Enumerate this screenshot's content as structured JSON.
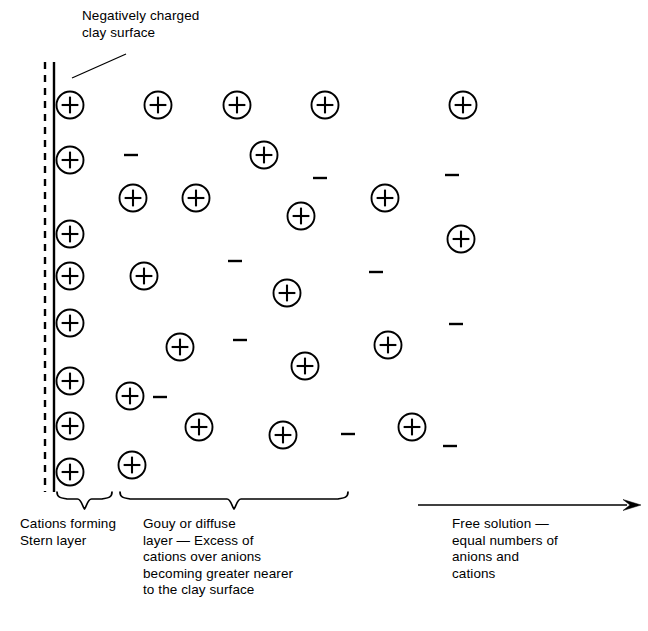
{
  "figure": {
    "type": "diagram",
    "background_color": "#ffffff",
    "ink_color": "#000000",
    "width": 648,
    "height": 631
  },
  "annotations": {
    "surface_label": "Negatively charged\nclay surface",
    "leader_line": {
      "from_x": 126,
      "from_y": 54,
      "to_x": 72,
      "to_y": 78
    }
  },
  "clay_surface": {
    "dashed_line_x": 45,
    "solid_line_x": 54,
    "top_y": 62,
    "bottom_y": 492,
    "dash_pattern": "7,6"
  },
  "captions": [
    {
      "name": "stern-layer",
      "text": "Cations forming\nStern layer",
      "x": 20,
      "y": 516
    },
    {
      "name": "gouy-layer",
      "text": "Gouy or diffuse\nlayer — Excess of\ncations over anions\nbecoming greater nearer\nto the clay surface",
      "x": 143,
      "y": 516
    },
    {
      "name": "free-solution",
      "text": "Free solution —\nequal numbers of\nanions and\ncations",
      "x": 452,
      "y": 516
    }
  ],
  "braces": [
    {
      "name": "stern-brace",
      "x_start": 57,
      "x_end": 112,
      "y_top": 492,
      "tip_y": 509
    },
    {
      "name": "gouy-brace",
      "x_start": 120,
      "x_end": 348,
      "y_top": 492,
      "tip_y": 509
    }
  ],
  "arrow": {
    "name": "free-solution-arrow",
    "x_start": 418,
    "x_end": 641,
    "y": 505,
    "head_length": 18,
    "head_width": 11
  },
  "symbols": {
    "cation_glyph": "+",
    "anion_glyph": "−",
    "cation_radius": 13.5,
    "cation_count": 33,
    "anion_count": 12
  },
  "cations": [
    {
      "x": 70,
      "y": 105,
      "layer": "stern"
    },
    {
      "x": 70,
      "y": 160,
      "layer": "stern"
    },
    {
      "x": 70,
      "y": 234,
      "layer": "stern"
    },
    {
      "x": 70,
      "y": 276,
      "layer": "stern"
    },
    {
      "x": 70,
      "y": 323,
      "layer": "stern"
    },
    {
      "x": 70,
      "y": 381,
      "layer": "stern"
    },
    {
      "x": 70,
      "y": 426,
      "layer": "stern"
    },
    {
      "x": 70,
      "y": 472,
      "layer": "stern"
    },
    {
      "x": 158,
      "y": 105,
      "layer": "gouy"
    },
    {
      "x": 237,
      "y": 105,
      "layer": "gouy"
    },
    {
      "x": 325,
      "y": 105,
      "layer": "gouy"
    },
    {
      "x": 463,
      "y": 105,
      "layer": "free"
    },
    {
      "x": 264,
      "y": 155,
      "layer": "gouy"
    },
    {
      "x": 133,
      "y": 198,
      "layer": "gouy"
    },
    {
      "x": 196,
      "y": 198,
      "layer": "gouy"
    },
    {
      "x": 385,
      "y": 198,
      "layer": "free"
    },
    {
      "x": 301,
      "y": 216,
      "layer": "gouy"
    },
    {
      "x": 461,
      "y": 239,
      "layer": "free"
    },
    {
      "x": 144,
      "y": 276,
      "layer": "gouy"
    },
    {
      "x": 287,
      "y": 293,
      "layer": "gouy"
    },
    {
      "x": 180,
      "y": 347,
      "layer": "gouy"
    },
    {
      "x": 388,
      "y": 345,
      "layer": "free"
    },
    {
      "x": 305,
      "y": 366,
      "layer": "gouy"
    },
    {
      "x": 130,
      "y": 396,
      "layer": "gouy"
    },
    {
      "x": 199,
      "y": 427,
      "layer": "gouy"
    },
    {
      "x": 283,
      "y": 435,
      "layer": "gouy"
    },
    {
      "x": 412,
      "y": 427,
      "layer": "free"
    },
    {
      "x": 132,
      "y": 465,
      "layer": "gouy"
    }
  ],
  "anions": [
    {
      "x": 131,
      "y": 155
    },
    {
      "x": 320,
      "y": 178
    },
    {
      "x": 452,
      "y": 175
    },
    {
      "x": 235,
      "y": 261
    },
    {
      "x": 376,
      "y": 272
    },
    {
      "x": 240,
      "y": 340
    },
    {
      "x": 456,
      "y": 324
    },
    {
      "x": 160,
      "y": 397
    },
    {
      "x": 348,
      "y": 434
    },
    {
      "x": 450,
      "y": 446
    }
  ]
}
